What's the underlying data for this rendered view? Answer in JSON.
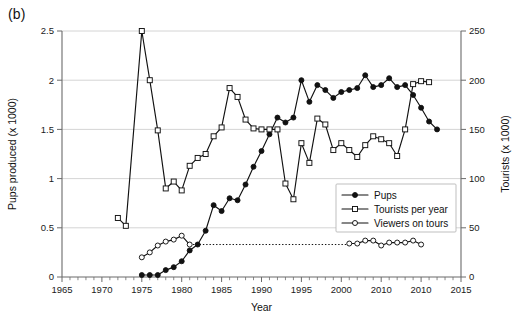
{
  "figure": {
    "panel_label": "(b)"
  },
  "chart_data": {
    "type": "line",
    "title": "",
    "xlabel": "Year",
    "ylabel": "Pups produced (x 1000)",
    "y2label": "Tourists (x 1000)",
    "xlim": [
      1965,
      2015
    ],
    "ylim": [
      0,
      2.5
    ],
    "y2lim": [
      0,
      250
    ],
    "grid": true,
    "xticks": [
      1965,
      1970,
      1975,
      1980,
      1985,
      1990,
      1995,
      2000,
      2005,
      2010,
      2015
    ],
    "xticklabels": [
      "1965",
      "1970",
      "1975",
      "1980",
      "1985",
      "1990",
      "1995",
      "2000",
      "2010",
      "2010",
      "2015"
    ],
    "xminor_step": 1,
    "yticks": [
      0,
      0.5,
      1,
      1.5,
      2,
      2.5
    ],
    "yticklabels": [
      "0",
      "0.5",
      "1",
      "1.5",
      "2",
      "2.5"
    ],
    "y2ticks": [
      0,
      50,
      100,
      150,
      200,
      250
    ],
    "y2ticklabels": [
      "0",
      "50",
      "100",
      "150",
      "200",
      "250"
    ],
    "legend_position": "center-right",
    "legend": [
      {
        "label": "Pups",
        "marker": "filled-circle",
        "axis": "left"
      },
      {
        "label": "Tourists per year",
        "marker": "open-square",
        "axis": "right"
      },
      {
        "label": "Viewers on tours",
        "marker": "open-circle",
        "axis": "right"
      }
    ],
    "annotations": [
      {
        "type": "dotted-horizontal",
        "axis": "left",
        "y": 0.33,
        "x_start": 1981,
        "x_end": 2001
      }
    ],
    "series": [
      {
        "name": "Pups",
        "marker": "filled-circle",
        "axis": "left",
        "x": [
          1975,
          1976,
          1977,
          1978,
          1979,
          1980,
          1981,
          1982,
          1983,
          1984,
          1985,
          1986,
          1987,
          1988,
          1989,
          1990,
          1991,
          1992,
          1993,
          1994,
          1995,
          1996,
          1997,
          1998,
          1999,
          2000,
          2001,
          2002,
          2003,
          2004,
          2005,
          2006,
          2007,
          2008,
          2009,
          2010,
          2011,
          2012
        ],
        "y": [
          0.02,
          0.02,
          0.02,
          0.07,
          0.1,
          0.16,
          0.27,
          0.33,
          0.47,
          0.73,
          0.67,
          0.8,
          0.78,
          0.94,
          1.12,
          1.28,
          1.45,
          1.62,
          1.57,
          1.62,
          2.0,
          1.78,
          1.95,
          1.9,
          1.82,
          1.88,
          1.9,
          1.92,
          2.05,
          1.93,
          1.95,
          2.02,
          1.93,
          1.95,
          1.85,
          1.72,
          1.58,
          1.5
        ]
      },
      {
        "name": "Tourists per year",
        "marker": "open-square",
        "axis": "right",
        "x": [
          1972,
          1973,
          1975,
          1976,
          1977,
          1978,
          1979,
          1980,
          1981,
          1982,
          1983,
          1984,
          1985,
          1986,
          1987,
          1988,
          1989,
          1990,
          1991,
          1992,
          1993,
          1994,
          1995,
          1996,
          1997,
          1998,
          1999,
          2000,
          2001,
          2002,
          2003,
          2004,
          2005,
          2006,
          2007,
          2008,
          2009,
          2010,
          2011
        ],
        "y": [
          60,
          52,
          250,
          200,
          149,
          90,
          97,
          88,
          113,
          121,
          125,
          143,
          152,
          192,
          183,
          160,
          151,
          150,
          150,
          150,
          95,
          79,
          136,
          116,
          161,
          155,
          129,
          136,
          129,
          122,
          134,
          143,
          140,
          136,
          123,
          150,
          196,
          199,
          198
        ]
      },
      {
        "name": "Viewers on tours",
        "marker": "open-circle",
        "axis": "right",
        "x": [
          1975,
          1976,
          1977,
          1978,
          1979,
          1980,
          1981,
          2001,
          2002,
          2003,
          2004,
          2005,
          2006,
          2007,
          2008,
          2009,
          2010
        ],
        "y": [
          20,
          25,
          32,
          36,
          38,
          42,
          33,
          34,
          34,
          37,
          37,
          32,
          35,
          35,
          35,
          37,
          33
        ]
      }
    ]
  }
}
